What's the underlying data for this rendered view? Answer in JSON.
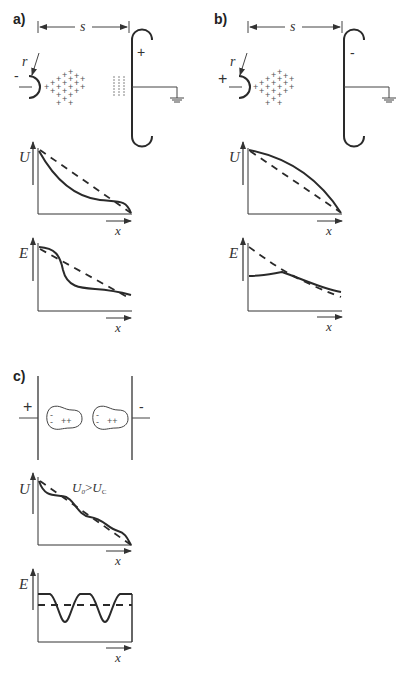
{
  "figure": {
    "panels": [
      {
        "id": "a",
        "label": "a)",
        "distance_label": "s",
        "radius_label": "r",
        "point_electrode_sign": "-",
        "plane_electrode_sign": "+",
        "space_charge": "+",
        "plots": [
          {
            "ylabel": "U",
            "xlabel": "x"
          },
          {
            "ylabel": "E",
            "xlabel": "x"
          }
        ]
      },
      {
        "id": "b",
        "label": "b)",
        "distance_label": "s",
        "radius_label": "r",
        "point_electrode_sign": "+",
        "plane_electrode_sign": "-",
        "space_charge": "+",
        "plots": [
          {
            "ylabel": "U",
            "xlabel": "x"
          },
          {
            "ylabel": "E",
            "xlabel": "x"
          }
        ]
      },
      {
        "id": "c",
        "label": "c)",
        "left_electrode_sign": "+",
        "right_electrode_sign": "-",
        "dipole_charges": [
          "-",
          "-",
          "++"
        ],
        "annotation": {
          "main": "U",
          "sub0": "0",
          "gt": ">",
          "main2": "U",
          "subc": "C"
        },
        "plots": [
          {
            "ylabel": "U",
            "xlabel": "x"
          },
          {
            "ylabel": "E",
            "xlabel": "x"
          }
        ]
      }
    ]
  }
}
